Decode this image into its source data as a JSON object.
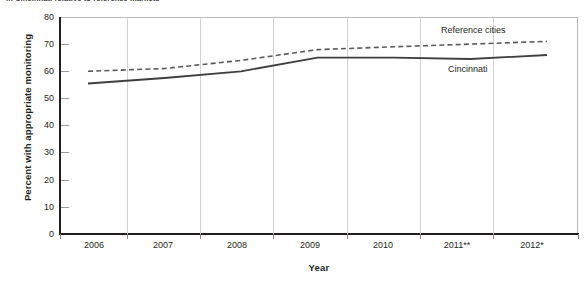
{
  "figure": {
    "title_cutoff": "in Cincinnati relative to reference markets",
    "background": "#ffffff",
    "series_colors": {
      "cincinnati": "#3f3f3f",
      "reference_cities": "#5a5a5a"
    }
  },
  "axes": {
    "y_title": "Percent with appropriate monitoring",
    "x_title": "Year",
    "y_ticks": [
      "80",
      "70",
      "60",
      "50",
      "40",
      "30",
      "20",
      "10",
      "0"
    ],
    "x_ticks": [
      "2006",
      "2007",
      "2008",
      "2009",
      "2010",
      "2011**",
      "2012*"
    ]
  },
  "legend": {
    "reference_cities": "Reference cities",
    "cincinnati": "Cincinnati"
  },
  "chart_data": {
    "type": "line",
    "title": "in Cincinnati relative to reference markets",
    "xlabel": "Year",
    "ylabel": "Percent with appropriate monitoring",
    "categories": [
      "2006",
      "2007",
      "2008",
      "2009",
      "2010",
      "2011**",
      "2012*"
    ],
    "x": [
      2006,
      2007,
      2008,
      2009,
      2010,
      2011,
      2012
    ],
    "ylim": [
      0,
      80
    ],
    "ytick_step": 10,
    "grid": false,
    "legend_position": "inline-right",
    "series": [
      {
        "name": "Reference cities",
        "style": "dashed",
        "color": "#5a5a5a",
        "values": [
          60,
          61,
          64,
          68,
          69,
          70,
          71
        ]
      },
      {
        "name": "Cincinnati",
        "style": "solid",
        "color": "#3f3f3f",
        "values": [
          55.5,
          57.5,
          60,
          65,
          65,
          64.5,
          66
        ]
      }
    ]
  }
}
